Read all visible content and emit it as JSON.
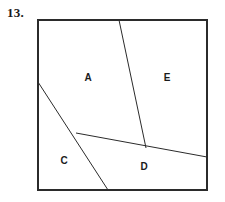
{
  "figure": {
    "problem_number": "13.",
    "canvas": {
      "width": 225,
      "height": 202,
      "background": "#ffffff"
    },
    "frame": {
      "x": 38,
      "y": 20,
      "width": 169,
      "height": 170,
      "stroke": "#2b2b2b",
      "fill": "#ffffff"
    },
    "lines": [
      {
        "id": "line-steep-top",
        "description": "steep line from top edge down to interior junction",
        "x1": 119,
        "y1": 20,
        "x2": 146,
        "y2": 148,
        "stroke": "#2b2b2b"
      },
      {
        "id": "line-shallow-right",
        "description": "shallow line from left junction rightward to right edge",
        "x1": 76,
        "y1": 133,
        "x2": 207,
        "y2": 157,
        "stroke": "#2b2b2b"
      },
      {
        "id": "line-diagonal-left",
        "description": "diagonal from left edge down to bottom edge",
        "x1": 38,
        "y1": 82,
        "x2": 108,
        "y2": 190,
        "stroke": "#2b2b2b"
      }
    ],
    "region_labels": [
      {
        "id": "label-a",
        "text": "A",
        "x": 88,
        "y": 78
      },
      {
        "id": "label-e",
        "text": "E",
        "x": 167,
        "y": 78
      },
      {
        "id": "label-c",
        "text": "C",
        "x": 64,
        "y": 161
      },
      {
        "id": "label-d",
        "text": "D",
        "x": 144,
        "y": 167
      }
    ]
  }
}
